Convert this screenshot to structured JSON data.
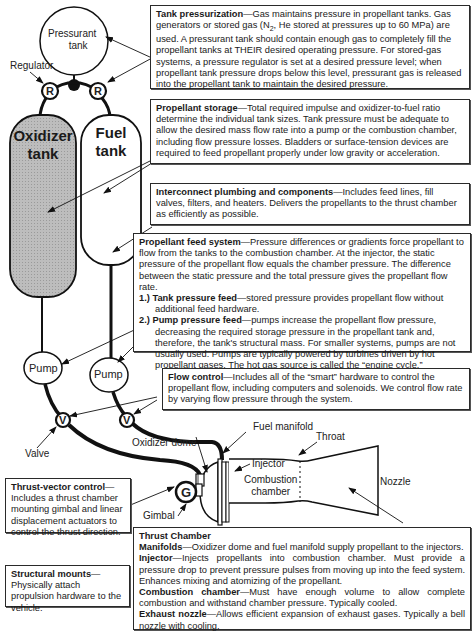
{
  "labels": {
    "pressurant_tank": [
      "Pressurant",
      "tank"
    ],
    "regulator": "Regulator",
    "regulator_symbol": "R",
    "oxidizer_tank": [
      "Oxidizer",
      "tank"
    ],
    "fuel_tank": [
      "Fuel",
      "tank"
    ],
    "pump": "Pump",
    "valve_symbol": "V",
    "valve": "Valve",
    "oxidizer_dome": "Oxidizer dome",
    "fuel_manifold": "Fuel manifold",
    "throat": "Throat",
    "injector": "Injector",
    "combustion_chamber": [
      "Combustion",
      "chamber"
    ],
    "nozzle": "Nozzle",
    "gimbal_symbol": "G",
    "gimbal": "Gimbal"
  },
  "boxes": {
    "tank_pressurization": {
      "title": "Tank pressurization",
      "text_a": "—Gas maintains pressure in propellant tanks. Gas generators or stored gas (N",
      "sub": "2",
      "text_b": ", He stored at pressures up to 60 MPa) are used. A pressurant tank should contain enough gas to completely fill the propellant tanks at THEIR desired operating pressure. For stored-gas systems, a pressure regulator is set at a desired pressure level; when propellant tank pressure drops below this level, pressurant gas is released into the propellant tank to maintain the desired pressure."
    },
    "propellant_storage": {
      "title": "Propellant storage",
      "text": "—Total required impulse and oxidizer-to-fuel ratio determine the individual tank sizes. Tank pressure must be adequate to allow the desired mass flow rate into a pump or the combustion chamber, including flow pressure losses. Bladders or surface-tension devices are required to feed propellant properly under low gravity or acceleration."
    },
    "interconnect": {
      "title": "Interconnect plumbing and components",
      "text": "—Includes feed lines, fill valves, filters, and heaters. Delivers the propellants to the thrust chamber as efficiently as possible."
    },
    "feed_system": {
      "title": "Propellant feed system",
      "text": "—Pressure differences or gradients force propellant to flow from the tanks to the combustion chamber. At the injector, the static pressure of the propellant flow equals the chamber pressure. The difference between the static pressure and the total pressure gives the propellant flow rate.",
      "items": [
        {
          "num": "1.)",
          "title": "Tank pressure feed",
          "text": "—stored pressure provides propellant flow without additional feed hardware."
        },
        {
          "num": "2.)",
          "title": "Pump pressure feed",
          "text": "—pumps increase the propellant flow pressure, decreasing the required storage pressure in the propellant tank and, therefore, the tank's structural mass. For smaller systems, pumps are not usually used. Pumps are typically powered by turbines driven by hot propellant gases. The hot gas source is called the “engine cycle.”"
        }
      ]
    },
    "flow_control": {
      "title": "Flow control",
      "text": "—Includes all of the “smart” hardware to control the propellant flow, including computers and solenoids. We control flow rate by varying flow pressure through the system."
    },
    "thrust_vector": {
      "title": "Thrust-vector control",
      "text": "—Includes a thrust chamber mounting gimbal and linear displacement actuators to control the thrust direction."
    },
    "structural_mounts": {
      "title": "Structural mounts",
      "text": "—Physically attach propulsion hardware to the vehicle."
    },
    "thrust_chamber": {
      "title": "Thrust Chamber",
      "items": [
        {
          "title": "Manifolds",
          "text": "—Oxidizer dome and fuel manifold supply propellant to the injectors."
        },
        {
          "title": "Injector",
          "text": "—Injects propellants into combustion chamber. Must provide a pressure drop to prevent pressure pulses from moving up into the feed system. Enhances mixing and atomizing of the propellant."
        },
        {
          "title": "Combustion chamber",
          "text": "—Must have enough volume to allow complete combustion and withstand chamber pressure. Typically cooled."
        },
        {
          "title": "Exhaust nozzle",
          "text": "—Allows efficient expansion of exhaust gases. Typically a bell nozzle with cooling."
        }
      ]
    }
  },
  "colors": {
    "oxidizer_fill": "#b8b8b8",
    "line": "#111111"
  }
}
